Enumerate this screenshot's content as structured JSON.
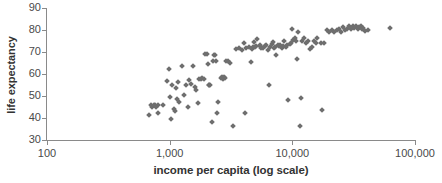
{
  "chart_data": {
    "type": "scatter",
    "title": "",
    "xlabel": "income per capita (log scale)",
    "ylabel": "life expectancy",
    "xscale": "log",
    "xlim": [
      100,
      100000
    ],
    "ylim": [
      30,
      90
    ],
    "grid": false,
    "legend": null,
    "xticks": [
      100,
      1000,
      10000,
      100000
    ],
    "xtick_labels": [
      "100",
      "1,000",
      "10,000",
      "100,000"
    ],
    "yticks": [
      30,
      40,
      50,
      60,
      70,
      80,
      90
    ],
    "ytick_labels": [
      "30",
      "40",
      "50",
      "60",
      "70",
      "80",
      "90"
    ],
    "marker": "diamond",
    "marker_color": "#6e6e6e",
    "axis_color": "#8a8a8a",
    "points": [
      [
        680,
        41.4
      ],
      [
        700,
        45.9
      ],
      [
        720,
        45.2
      ],
      [
        745,
        46.0
      ],
      [
        760,
        46.1
      ],
      [
        780,
        44.9
      ],
      [
        800,
        45.9
      ],
      [
        810,
        42.2
      ],
      [
        880,
        46.0
      ],
      [
        950,
        56.6
      ],
      [
        980,
        62.5
      ],
      [
        1000,
        49.4
      ],
      [
        1020,
        39.4
      ],
      [
        1050,
        55.2
      ],
      [
        1080,
        43.9
      ],
      [
        1100,
        43.1
      ],
      [
        1120,
        53.5
      ],
      [
        1150,
        48.6
      ],
      [
        1180,
        56.3
      ],
      [
        1200,
        47.2
      ],
      [
        1250,
        63.7
      ],
      [
        1300,
        50.6
      ],
      [
        1350,
        54.8
      ],
      [
        1400,
        45.1
      ],
      [
        1450,
        57.4
      ],
      [
        1500,
        55.3
      ],
      [
        1550,
        63.7
      ],
      [
        1600,
        54.0
      ],
      [
        1650,
        52.7
      ],
      [
        1700,
        46.9
      ],
      [
        1750,
        57.6
      ],
      [
        1800,
        57.7
      ],
      [
        1850,
        58.0
      ],
      [
        1900,
        57.6
      ],
      [
        1950,
        68.9
      ],
      [
        2000,
        69.2
      ],
      [
        2050,
        64.6
      ],
      [
        2080,
        55.0
      ],
      [
        2100,
        54.8
      ],
      [
        2150,
        55.2
      ],
      [
        2200,
        38.4
      ],
      [
        2250,
        66.0
      ],
      [
        2300,
        68.8
      ],
      [
        2350,
        68.6
      ],
      [
        2400,
        66.0
      ],
      [
        2450,
        42.2
      ],
      [
        2500,
        47.2
      ],
      [
        2600,
        58.0
      ],
      [
        2650,
        58.5
      ],
      [
        2700,
        57.9
      ],
      [
        2750,
        58.6
      ],
      [
        2800,
        58.4
      ],
      [
        2900,
        66.0
      ],
      [
        3000,
        65.9
      ],
      [
        3100,
        64.8
      ],
      [
        3300,
        36.2
      ],
      [
        3500,
        71.5
      ],
      [
        3700,
        72.0
      ],
      [
        3900,
        71.0
      ],
      [
        4000,
        74.0
      ],
      [
        4100,
        42.4
      ],
      [
        4200,
        71.9
      ],
      [
        4400,
        72.3
      ],
      [
        4600,
        65.6
      ],
      [
        4700,
        71.2
      ],
      [
        4800,
        72.5
      ],
      [
        4900,
        74.7
      ],
      [
        5000,
        72.4
      ],
      [
        5100,
        72.9
      ],
      [
        5200,
        76.0
      ],
      [
        5400,
        72.6
      ],
      [
        5500,
        73.0
      ],
      [
        5600,
        72.0
      ],
      [
        5800,
        71.7
      ],
      [
        6000,
        72.8
      ],
      [
        6100,
        73.1
      ],
      [
        6300,
        71.0
      ],
      [
        6500,
        55.0
      ],
      [
        6600,
        72.2
      ],
      [
        6800,
        73.6
      ],
      [
        7000,
        74.5
      ],
      [
        7100,
        71.8
      ],
      [
        7200,
        72.4
      ],
      [
        7400,
        68.6
      ],
      [
        7600,
        73.0
      ],
      [
        7800,
        72.8
      ],
      [
        8000,
        73.3
      ],
      [
        8200,
        71.8
      ],
      [
        8400,
        72.9
      ],
      [
        8600,
        74.9
      ],
      [
        8800,
        72.2
      ],
      [
        9000,
        73.1
      ],
      [
        9300,
        48.2
      ],
      [
        9500,
        73.7
      ],
      [
        9800,
        74.0
      ],
      [
        10000,
        80.3
      ],
      [
        10200,
        75.5
      ],
      [
        10500,
        76.4
      ],
      [
        10800,
        75.1
      ],
      [
        11000,
        66.9
      ],
      [
        11200,
        79.2
      ],
      [
        11500,
        36.5
      ],
      [
        11800,
        48.9
      ],
      [
        12000,
        75.2
      ],
      [
        12500,
        76.2
      ],
      [
        13000,
        74.2
      ],
      [
        13500,
        74.9
      ],
      [
        14000,
        71.5
      ],
      [
        14500,
        72.4
      ],
      [
        15000,
        75.1
      ],
      [
        15500,
        74.0
      ],
      [
        16000,
        76.3
      ],
      [
        17000,
        73.9
      ],
      [
        17500,
        43.7
      ],
      [
        18000,
        74.0
      ],
      [
        19000,
        80.0
      ],
      [
        20000,
        79.3
      ],
      [
        21000,
        80.1
      ],
      [
        22000,
        79.2
      ],
      [
        23000,
        80.0
      ],
      [
        24000,
        80.6
      ],
      [
        25000,
        79.1
      ],
      [
        26000,
        81.4
      ],
      [
        27000,
        80.2
      ],
      [
        28000,
        80.6
      ],
      [
        29000,
        81.6
      ],
      [
        30000,
        80.4
      ],
      [
        31000,
        81.8
      ],
      [
        32000,
        80.9
      ],
      [
        33000,
        82.0
      ],
      [
        34000,
        80.5
      ],
      [
        35000,
        81.3
      ],
      [
        36000,
        81.8
      ],
      [
        37000,
        80.4
      ],
      [
        38000,
        81.0
      ],
      [
        39000,
        79.4
      ],
      [
        41000,
        80.2
      ],
      [
        63000,
        80.8
      ]
    ]
  }
}
